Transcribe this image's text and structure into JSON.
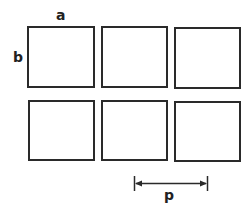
{
  "diagram": {
    "labels": {
      "width_label": "a",
      "height_label": "b",
      "pitch_label": "p"
    },
    "grid": {
      "rows": 2,
      "columns": 3
    },
    "colors": {
      "stroke": "#2a2a2a",
      "background": "#ffffff"
    }
  }
}
